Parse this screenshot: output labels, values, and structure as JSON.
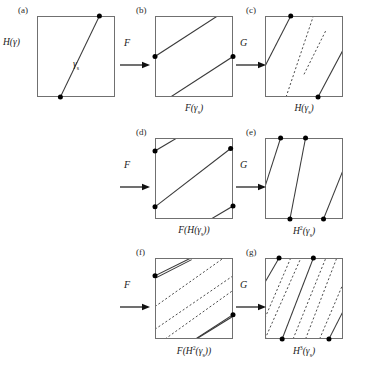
{
  "figure": {
    "type": "mathematical-diagram",
    "background_color": "#ffffff",
    "line_color": "#3a3a3a",
    "border_color": "#707070",
    "dot_color": "#000000"
  },
  "panels": [
    {
      "tag": "(a)",
      "caption": "",
      "side_label_html": "H(γ)",
      "inline_label_html": "γ<sub>s</sub>",
      "square": {
        "x": 37,
        "y": 16,
        "w": 78,
        "h": 81
      },
      "solid_lines": [
        {
          "x1": 0.3,
          "y1": 1.0,
          "x2": 0.8,
          "y2": 0.0
        }
      ],
      "dotted_lines": [],
      "dots": [
        {
          "x": 0.3,
          "y": 1.0
        },
        {
          "x": 0.8,
          "y": 0.0
        }
      ]
    },
    {
      "tag": "(b)",
      "caption_html": "F(γ<sub>s</sub>)",
      "square": {
        "x": 155,
        "y": 16,
        "w": 78,
        "h": 81
      },
      "solid_lines": [
        {
          "x1": 0.0,
          "y1": 0.5,
          "x2": 0.8,
          "y2": 0.0
        },
        {
          "x1": 0.2,
          "y1": 1.0,
          "x2": 1.0,
          "y2": 0.5
        }
      ],
      "dotted_lines": [],
      "dots": [
        {
          "x": 0.0,
          "y": 0.5
        },
        {
          "x": 1.0,
          "y": 0.5
        }
      ]
    },
    {
      "tag": "(c)",
      "caption_html": "H(γ<sub>s</sub>)",
      "square": {
        "x": 265,
        "y": 16,
        "w": 78,
        "h": 81
      },
      "solid_lines": [
        {
          "x1": 0.0,
          "y1": 0.62,
          "x2": 0.33,
          "y2": 0.0
        },
        {
          "x1": 0.68,
          "y1": 1.0,
          "x2": 1.0,
          "y2": 0.42
        }
      ],
      "dotted_lines": [
        {
          "x1": 0.27,
          "y1": 1.0,
          "x2": 0.62,
          "y2": 0.0
        },
        {
          "x1": 0.5,
          "y1": 0.72,
          "x2": 0.78,
          "y2": 0.18
        }
      ],
      "dots": [
        {
          "x": 0.33,
          "y": 0.0
        },
        {
          "x": 0.68,
          "y": 1.0
        }
      ]
    },
    {
      "tag": "(d)",
      "caption_html": "F(H(γ<sub>s</sub>))",
      "square": {
        "x": 155,
        "y": 138,
        "w": 78,
        "h": 81
      },
      "solid_lines": [
        {
          "x1": 0.0,
          "y1": 0.16,
          "x2": 0.28,
          "y2": 0.0
        },
        {
          "x1": 0.0,
          "y1": 0.85,
          "x2": 0.97,
          "y2": 0.13
        },
        {
          "x1": 0.72,
          "y1": 1.0,
          "x2": 1.0,
          "y2": 0.84
        }
      ],
      "dotted_lines": [],
      "dots": [
        {
          "x": 0.0,
          "y": 0.16
        },
        {
          "x": 0.0,
          "y": 0.85
        },
        {
          "x": 0.97,
          "y": 0.13
        },
        {
          "x": 1.0,
          "y": 0.84
        }
      ]
    },
    {
      "tag": "(e)",
      "caption_html": "H<sup>2</sup>(γ<sub>s</sub>)",
      "square": {
        "x": 265,
        "y": 138,
        "w": 78,
        "h": 81
      },
      "solid_lines": [
        {
          "x1": 0.0,
          "y1": 0.6,
          "x2": 0.2,
          "y2": 0.0
        },
        {
          "x1": 0.32,
          "y1": 1.0,
          "x2": 0.52,
          "y2": 0.0
        },
        {
          "x1": 0.75,
          "y1": 1.0,
          "x2": 1.0,
          "y2": 0.4
        }
      ],
      "dotted_lines": [],
      "dots": [
        {
          "x": 0.2,
          "y": 0.0
        },
        {
          "x": 0.52,
          "y": 0.0
        },
        {
          "x": 0.32,
          "y": 1.0
        },
        {
          "x": 0.75,
          "y": 1.0
        }
      ]
    },
    {
      "tag": "(f)",
      "caption_html": "F(H<sup>2</sup>(γ<sub>s</sub>))",
      "square": {
        "x": 155,
        "y": 258,
        "w": 78,
        "h": 81
      },
      "solid_lines": [
        {
          "x1": 0.0,
          "y1": 0.22,
          "x2": 0.46,
          "y2": 0.0
        },
        {
          "x1": 0.0,
          "y1": 0.25,
          "x2": 0.47,
          "y2": 0.02
        },
        {
          "x1": 0.52,
          "y1": 1.0,
          "x2": 1.0,
          "y2": 0.7
        },
        {
          "x1": 0.53,
          "y1": 1.0,
          "x2": 1.0,
          "y2": 0.72
        }
      ],
      "dotted_lines": [
        {
          "x1": 0.0,
          "y1": 0.6,
          "x2": 0.88,
          "y2": 0.0
        },
        {
          "x1": 0.0,
          "y1": 0.88,
          "x2": 1.0,
          "y2": 0.22
        },
        {
          "x1": 0.13,
          "y1": 1.0,
          "x2": 1.0,
          "y2": 0.4
        }
      ],
      "dots": [
        {
          "x": 0.0,
          "y": 0.22
        },
        {
          "x": 1.0,
          "y": 0.7
        }
      ]
    },
    {
      "tag": "(g)",
      "caption_html": "H<sup>3</sup>(γ<sub>s</sub>)",
      "square": {
        "x": 265,
        "y": 258,
        "w": 78,
        "h": 81
      },
      "solid_lines": [
        {
          "x1": 0.0,
          "y1": 0.3,
          "x2": 0.18,
          "y2": 0.0
        },
        {
          "x1": 0.22,
          "y1": 1.0,
          "x2": 0.62,
          "y2": 0.0
        },
        {
          "x1": 0.82,
          "y1": 1.0,
          "x2": 1.0,
          "y2": 0.66
        }
      ],
      "dotted_lines": [
        {
          "x1": 0.0,
          "y1": 0.74,
          "x2": 0.33,
          "y2": 0.0
        },
        {
          "x1": 0.0,
          "y1": 1.0,
          "x2": 0.46,
          "y2": 0.0
        },
        {
          "x1": 0.36,
          "y1": 1.0,
          "x2": 0.78,
          "y2": 0.0
        },
        {
          "x1": 0.52,
          "y1": 1.0,
          "x2": 0.92,
          "y2": 0.0
        },
        {
          "x1": 0.7,
          "y1": 1.0,
          "x2": 1.0,
          "y2": 0.32
        }
      ],
      "dots": [
        {
          "x": 0.18,
          "y": 0.0
        },
        {
          "x": 0.62,
          "y": 0.0
        },
        {
          "x": 0.22,
          "y": 1.0
        },
        {
          "x": 0.82,
          "y": 1.0
        }
      ]
    }
  ],
  "arrows": [
    {
      "label": "F",
      "x": 120,
      "y": 56,
      "label_x": 124,
      "label_y": 38
    },
    {
      "label": "G",
      "x": 236,
      "y": 56,
      "label_x": 240,
      "label_y": 38
    },
    {
      "label": "F",
      "x": 120,
      "y": 178,
      "label_x": 124,
      "label_y": 160
    },
    {
      "label": "G",
      "x": 236,
      "y": 178,
      "label_x": 240,
      "label_y": 160
    },
    {
      "label": "F",
      "x": 120,
      "y": 298,
      "label_x": 124,
      "label_y": 280
    },
    {
      "label": "G",
      "x": 236,
      "y": 298,
      "label_x": 240,
      "label_y": 280
    }
  ],
  "labels": {
    "panel_a_side": "H(γ)",
    "panel_a_curve": "γs",
    "map_f": "F",
    "map_g": "G"
  }
}
